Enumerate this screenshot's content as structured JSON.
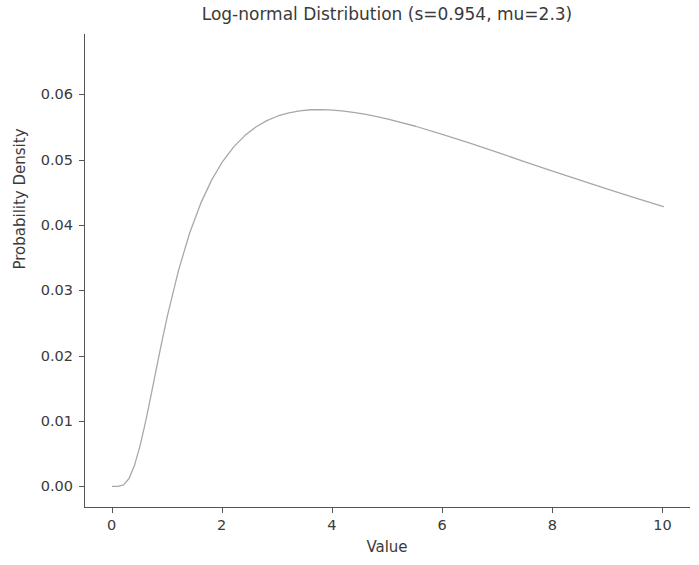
{
  "chart_data": {
    "type": "line",
    "title": "Log-normal Distribution (s=0.954, mu=2.3)",
    "xlabel": "Value",
    "ylabel": "Probability Density",
    "xlim": [
      -0.5,
      10.5
    ],
    "ylim": [
      -0.0033,
      0.0692
    ],
    "grid": false,
    "legend": null,
    "xticks": [
      0,
      2,
      4,
      6,
      8,
      10
    ],
    "xtick_labels": [
      "0",
      "2",
      "4",
      "6",
      "8",
      "10"
    ],
    "yticks": [
      0.0,
      0.01,
      0.02,
      0.03,
      0.04,
      0.05,
      0.06
    ],
    "ytick_labels": [
      "0.00",
      "0.01",
      "0.02",
      "0.03",
      "0.04",
      "0.05",
      "0.06"
    ],
    "series": [
      {
        "name": "Log-normal PDF",
        "color": "#a8a8a8",
        "linewidth": 1.3,
        "x": [
          0.0,
          0.1,
          0.2,
          0.3,
          0.4,
          0.5,
          0.6,
          0.7,
          0.8,
          0.9,
          1.0,
          1.2,
          1.4,
          1.6,
          1.8,
          2.0,
          2.2,
          2.4,
          2.6,
          2.8,
          3.0,
          3.2,
          3.4,
          3.6,
          3.8,
          4.0,
          4.2,
          4.4,
          4.6,
          4.8,
          5.0,
          5.5,
          6.0,
          6.5,
          7.0,
          7.5,
          8.0,
          8.5,
          9.0,
          9.5,
          10.0
        ],
        "y": [
          0.0,
          1e-05,
          0.00023,
          0.00121,
          0.00325,
          0.00623,
          0.00992,
          0.01401,
          0.01822,
          0.02235,
          0.02625,
          0.03312,
          0.03876,
          0.04329,
          0.04689,
          0.04973,
          0.05194,
          0.05366,
          0.05497,
          0.05595,
          0.05666,
          0.05715,
          0.05745,
          0.05761,
          0.05764,
          0.05756,
          0.05741,
          0.05718,
          0.05689,
          0.05656,
          0.05619,
          0.05509,
          0.05382,
          0.05246,
          0.05105,
          0.04962,
          0.0482,
          0.0468,
          0.04543,
          0.0441,
          0.04281
        ]
      }
    ],
    "params": {
      "s": "0.954",
      "mu": "2.3"
    }
  },
  "figure": {
    "background_color": "#ffffff",
    "axis_color": "#555555",
    "text_color": "#3a3a3a"
  }
}
